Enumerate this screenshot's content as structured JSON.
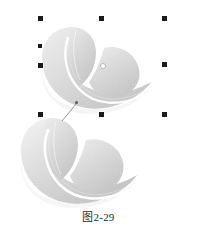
{
  "figure": {
    "caption": "图2-29",
    "background_color": "#ffffff"
  },
  "artwork": {
    "shape_name": "cloud-heart-shape",
    "fill_light": "#f3f3f3",
    "fill_mid": "#d8d8d8",
    "fill_dark": "#bfbfbf",
    "highlight_color": "#ffffff",
    "shadow_color": "#e8e8e8",
    "objects": [
      {
        "id": "top-shape",
        "label": "Selected cloud shape (top)",
        "selected": true
      },
      {
        "id": "bottom-shape",
        "label": "Cloud shape copy (bottom)",
        "selected": false
      }
    ]
  },
  "selection": {
    "name": "selection-handles",
    "handle_color": "#1a1a1a",
    "handle_size": 5,
    "center_marker": {
      "x": 102,
      "y": 65
    },
    "handles": [
      {
        "name": "handle-top-left",
        "x": 40,
        "y": 18
      },
      {
        "name": "handle-top-center",
        "x": 101,
        "y": 18
      },
      {
        "name": "handle-top-right",
        "x": 164,
        "y": 18
      },
      {
        "name": "handle-middle-left",
        "x": 40,
        "y": 65
      },
      {
        "name": "handle-middle-right",
        "x": 164,
        "y": 65
      },
      {
        "name": "handle-bottom-left",
        "x": 40,
        "y": 114
      },
      {
        "name": "handle-bottom-center",
        "x": 101,
        "y": 114
      },
      {
        "name": "handle-bottom-right",
        "x": 164,
        "y": 114
      }
    ],
    "extra_handles": [
      {
        "name": "handle-edge-left-upper",
        "x": 40,
        "y": 46
      }
    ]
  },
  "annotation": {
    "name": "leader-line",
    "from": {
      "x": 62,
      "y": 120
    },
    "to": {
      "x": 77,
      "y": 103
    },
    "node": {
      "x": 76,
      "y": 102
    },
    "color": "#6b6b6b"
  }
}
